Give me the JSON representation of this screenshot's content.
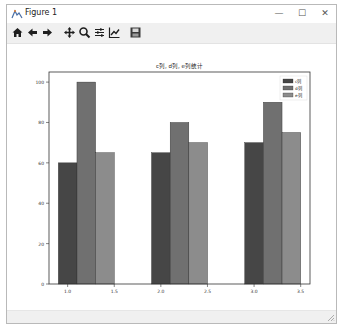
{
  "window": {
    "title": "Figure 1",
    "controls": {
      "minimize": "—",
      "maximize": "☐",
      "close": "✕"
    }
  },
  "toolbar": {
    "buttons": [
      {
        "name": "home-icon",
        "tooltip": "Home"
      },
      {
        "name": "back-arrow-icon",
        "tooltip": "Back"
      },
      {
        "name": "forward-arrow-icon",
        "tooltip": "Forward"
      },
      {
        "name": "pan-icon",
        "tooltip": "Pan"
      },
      {
        "name": "zoom-icon",
        "tooltip": "Zoom"
      },
      {
        "name": "subplots-icon",
        "tooltip": "Configure subplots"
      },
      {
        "name": "edit-axis-icon",
        "tooltip": "Edit axis"
      },
      {
        "name": "save-icon",
        "tooltip": "Save"
      }
    ]
  },
  "colors": {
    "c": "#464646",
    "d": "#707070",
    "e": "#8c8c8c",
    "edge": "#2a2a2a"
  },
  "chart_data": {
    "type": "bar",
    "title": "c列, d列, e列统计",
    "xlabel": "",
    "ylabel": "",
    "categories": [
      1,
      2,
      3
    ],
    "bar_width": 0.2,
    "series": [
      {
        "name": "c列",
        "offset": 0.0,
        "values": [
          60,
          65,
          70
        ]
      },
      {
        "name": "d列",
        "offset": 0.2,
        "values": [
          100,
          80,
          90
        ]
      },
      {
        "name": "e列",
        "offset": 0.4,
        "values": [
          65,
          70,
          75
        ]
      }
    ],
    "xticks": [
      "1.0",
      "1.5",
      "2.0",
      "2.5",
      "3.0",
      "3.5"
    ],
    "xtick_values": [
      1.0,
      1.5,
      2.0,
      2.5,
      3.0,
      3.5
    ],
    "yticks": [
      "0",
      "20",
      "40",
      "60",
      "80",
      "100"
    ],
    "ytick_values": [
      0,
      20,
      40,
      60,
      80,
      100
    ],
    "xlim": [
      0.8,
      3.6
    ],
    "ylim": [
      0,
      105
    ],
    "grid": false,
    "legend_position": "upper right"
  }
}
